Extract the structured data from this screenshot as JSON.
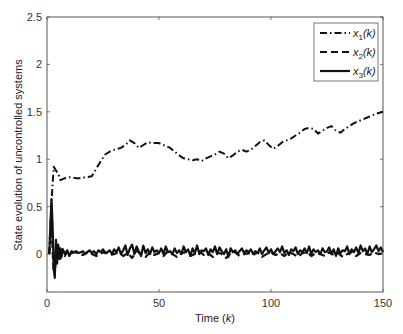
{
  "chart_data": {
    "type": "line",
    "title": "",
    "xlabel": "Time (k)",
    "xlabel_parts": {
      "text": "Time (",
      "italic": "k",
      "close": ")"
    },
    "ylabel": "State evolution of uncontrolled systems",
    "xlim": [
      0,
      150
    ],
    "ylim": [
      -0.4,
      2.5
    ],
    "xticks": [
      0,
      50,
      100,
      150
    ],
    "xtick_labels": [
      "0",
      "50",
      "100",
      "150"
    ],
    "yticks": [
      0,
      0.5,
      1,
      1.5,
      2,
      2.5
    ],
    "ytick_labels": [
      "0",
      "0.5",
      "1",
      "1.5",
      "2",
      "2.5"
    ],
    "grid": false,
    "legend_position": "upper right",
    "series": [
      {
        "name": "x1(k)",
        "label_base": "x",
        "label_sub": "1",
        "label_arg": "(k)",
        "style": "dash-dot",
        "x": [
          1,
          2,
          3,
          4,
          5,
          6,
          8,
          10,
          13,
          15,
          17,
          20,
          22,
          24,
          26,
          28,
          30,
          33,
          35,
          37,
          39,
          41,
          43,
          45,
          47,
          50,
          53,
          55,
          57,
          59,
          61,
          63,
          65,
          67,
          69,
          71,
          73,
          75,
          77,
          79,
          81,
          83,
          85,
          87,
          89,
          91,
          93,
          95,
          97,
          99,
          101,
          103,
          105,
          107,
          109,
          111,
          113,
          115,
          117,
          119,
          121,
          123,
          125,
          127,
          129,
          131,
          133,
          135,
          137,
          139,
          141,
          143,
          145,
          147,
          150
        ],
        "values": [
          0.0,
          0.55,
          0.92,
          0.88,
          0.85,
          0.78,
          0.8,
          0.81,
          0.8,
          0.8,
          0.81,
          0.82,
          0.9,
          0.98,
          1.05,
          1.08,
          1.1,
          1.12,
          1.15,
          1.2,
          1.17,
          1.12,
          1.15,
          1.18,
          1.17,
          1.17,
          1.14,
          1.12,
          1.08,
          1.04,
          1.01,
          1.0,
          0.99,
          1.0,
          0.98,
          1.01,
          1.03,
          1.05,
          1.08,
          1.06,
          1.01,
          1.04,
          1.08,
          1.1,
          1.08,
          1.1,
          1.14,
          1.18,
          1.2,
          1.15,
          1.11,
          1.14,
          1.18,
          1.2,
          1.22,
          1.25,
          1.28,
          1.32,
          1.33,
          1.32,
          1.27,
          1.3,
          1.33,
          1.35,
          1.3,
          1.28,
          1.32,
          1.35,
          1.38,
          1.4,
          1.42,
          1.44,
          1.46,
          1.48,
          1.5
        ]
      },
      {
        "name": "x2(k)",
        "label_base": "x",
        "label_sub": "2",
        "label_arg": "(k)",
        "style": "dashed",
        "x": [
          1,
          2,
          3,
          4,
          5,
          6,
          7,
          8,
          9,
          10,
          12,
          14,
          16,
          18,
          20,
          22,
          24,
          26,
          28,
          30,
          32,
          34,
          36,
          38,
          40,
          42,
          44,
          46,
          48,
          50,
          52,
          54,
          56,
          58,
          60,
          62,
          64,
          66,
          68,
          70,
          72,
          74,
          76,
          78,
          80,
          82,
          84,
          86,
          88,
          90,
          92,
          94,
          96,
          98,
          100,
          102,
          104,
          106,
          108,
          110,
          112,
          114,
          116,
          118,
          120,
          122,
          124,
          126,
          128,
          130,
          132,
          134,
          136,
          138,
          140,
          142,
          144,
          146,
          148,
          150
        ],
        "values": [
          0.0,
          0.3,
          -0.2,
          -0.1,
          0.08,
          -0.05,
          0.05,
          -0.02,
          0.03,
          0.0,
          0.02,
          0.01,
          -0.01,
          0.02,
          0.0,
          -0.02,
          0.01,
          0.02,
          -0.01,
          0.0,
          0.02,
          -0.02,
          0.01,
          -0.04,
          0.03,
          0.0,
          -0.03,
          0.02,
          -0.01,
          0.01,
          -0.02,
          0.03,
          0.0,
          -0.03,
          0.01,
          0.02,
          -0.02,
          0.0,
          0.03,
          -0.01,
          0.01,
          -0.03,
          0.02,
          0.0,
          -0.04,
          0.01,
          0.02,
          -0.02,
          0.0,
          0.01,
          -0.01,
          0.02,
          -0.03,
          0.0,
          0.02,
          -0.01,
          0.01,
          -0.02,
          0.02,
          0.0,
          -0.03,
          0.01,
          0.02,
          -0.02,
          0.01,
          0.0,
          -0.02,
          0.02,
          -0.01,
          0.01,
          -0.03,
          0.0,
          0.02,
          -0.02,
          0.01,
          0.0,
          -0.01,
          0.02,
          0.0,
          0.01
        ]
      },
      {
        "name": "x3(k)",
        "label_base": "x",
        "label_sub": "3",
        "label_arg": "(k)",
        "style": "solid",
        "x": [
          1,
          2,
          2.5,
          3,
          3.5,
          4,
          4.5,
          5,
          5.5,
          6,
          6.5,
          7,
          8,
          9,
          10,
          11,
          12,
          13,
          14,
          15,
          16,
          17,
          18,
          19,
          20,
          21,
          22,
          23,
          24,
          25,
          26,
          27,
          28,
          29,
          30,
          31,
          32,
          33,
          34,
          35,
          36,
          37,
          38,
          39,
          40,
          41,
          42,
          43,
          44,
          45,
          46,
          47,
          48,
          49,
          50,
          51,
          52,
          53,
          54,
          55,
          56,
          57,
          58,
          59,
          60,
          61,
          62,
          63,
          64,
          65,
          66,
          67,
          68,
          69,
          70,
          71,
          72,
          73,
          74,
          75,
          76,
          77,
          78,
          79,
          80,
          81,
          82,
          83,
          84,
          85,
          86,
          87,
          88,
          89,
          90,
          91,
          92,
          93,
          94,
          95,
          96,
          97,
          98,
          99,
          100,
          101,
          102,
          103,
          104,
          105,
          106,
          107,
          108,
          109,
          110,
          111,
          112,
          113,
          114,
          115,
          116,
          117,
          118,
          119,
          120,
          121,
          122,
          123,
          124,
          125,
          126,
          127,
          128,
          129,
          130,
          131,
          132,
          133,
          134,
          135,
          136,
          137,
          138,
          139,
          140,
          141,
          142,
          143,
          144,
          145,
          146,
          147,
          148,
          149,
          150
        ],
        "values": [
          0.0,
          0.58,
          0.3,
          -0.15,
          -0.25,
          0.15,
          -0.1,
          0.1,
          -0.05,
          0.06,
          -0.03,
          0.05,
          0.0,
          0.04,
          -0.02,
          0.03,
          0.02,
          0.03,
          0.01,
          0.02,
          0.03,
          0.0,
          0.02,
          0.04,
          0.01,
          0.03,
          0.0,
          0.04,
          0.02,
          0.05,
          0.01,
          0.02,
          0.04,
          0.0,
          0.05,
          0.02,
          0.07,
          0.0,
          0.04,
          0.09,
          -0.01,
          0.06,
          0.1,
          0.0,
          0.08,
          0.03,
          -0.02,
          0.09,
          0.01,
          0.05,
          0.0,
          0.07,
          0.02,
          0.04,
          0.01,
          0.06,
          0.0,
          0.08,
          0.02,
          0.03,
          0.0,
          0.06,
          0.01,
          0.04,
          0.0,
          0.08,
          0.02,
          0.05,
          -0.02,
          0.06,
          0.01,
          0.09,
          0.0,
          0.04,
          0.03,
          0.06,
          -0.01,
          0.05,
          0.02,
          0.08,
          0.0,
          0.07,
          0.03,
          0.0,
          0.05,
          -0.03,
          0.06,
          0.02,
          0.04,
          0.0,
          0.03,
          0.06,
          0.01,
          0.04,
          0.02,
          0.05,
          0.0,
          0.03,
          0.01,
          0.06,
          0.0,
          0.04,
          0.07,
          0.01,
          0.05,
          0.0,
          0.03,
          0.06,
          0.02,
          0.08,
          0.01,
          0.04,
          -0.01,
          0.05,
          0.03,
          0.07,
          0.0,
          0.04,
          0.02,
          0.06,
          0.01,
          0.08,
          0.0,
          0.05,
          0.02,
          0.04,
          0.0,
          0.06,
          0.02,
          0.03,
          0.07,
          0.0,
          0.05,
          -0.02,
          0.06,
          0.01,
          0.04,
          0.03,
          0.08,
          0.0,
          0.05,
          0.02,
          0.07,
          0.01,
          0.09,
          0.03,
          0.06,
          0.0,
          0.08,
          0.02,
          0.05,
          0.09,
          0.03,
          0.07,
          0.02
        ]
      }
    ]
  }
}
